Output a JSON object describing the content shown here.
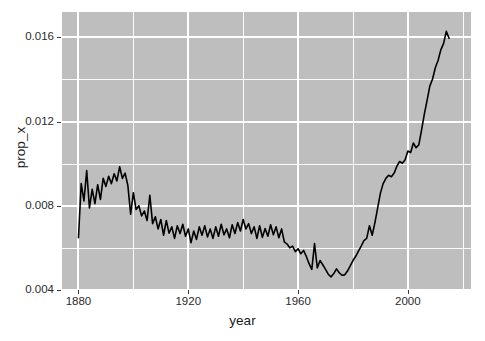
{
  "chart_data": {
    "type": "line",
    "title": "",
    "xlabel": "year",
    "ylabel": "prop_x",
    "xlim": [
      1874,
      2023
    ],
    "ylim": [
      0.004,
      0.0172
    ],
    "grid": true,
    "legend": "none",
    "x_ticks": [
      1880,
      1920,
      1960,
      2000
    ],
    "x_tick_labels": [
      "1880",
      "1920",
      "1960",
      "2000"
    ],
    "y_ticks": [
      0.004,
      0.008,
      0.012,
      0.016
    ],
    "y_tick_labels": [
      "0.004",
      "0.008",
      "0.012",
      "0.016"
    ],
    "x_minor_ticks": [
      1900,
      1940,
      1980,
      2020
    ],
    "y_minor_ticks": [
      0.006,
      0.01,
      0.014
    ],
    "series": [
      {
        "name": "prop_x",
        "color": "#000000",
        "x": [
          1880,
          1881,
          1882,
          1883,
          1884,
          1885,
          1886,
          1887,
          1888,
          1889,
          1890,
          1891,
          1892,
          1893,
          1894,
          1895,
          1896,
          1897,
          1898,
          1899,
          1900,
          1901,
          1902,
          1903,
          1904,
          1905,
          1906,
          1907,
          1908,
          1909,
          1910,
          1911,
          1912,
          1913,
          1914,
          1915,
          1916,
          1917,
          1918,
          1919,
          1920,
          1921,
          1922,
          1923,
          1924,
          1925,
          1926,
          1927,
          1928,
          1929,
          1930,
          1931,
          1932,
          1933,
          1934,
          1935,
          1936,
          1937,
          1938,
          1939,
          1940,
          1941,
          1942,
          1943,
          1944,
          1945,
          1946,
          1947,
          1948,
          1949,
          1950,
          1951,
          1952,
          1953,
          1954,
          1955,
          1956,
          1957,
          1958,
          1959,
          1960,
          1961,
          1962,
          1963,
          1964,
          1965,
          1966,
          1967,
          1968,
          1969,
          1970,
          1971,
          1972,
          1973,
          1974,
          1975,
          1976,
          1977,
          1978,
          1979,
          1980,
          1981,
          1982,
          1983,
          1984,
          1985,
          1986,
          1987,
          1988,
          1989,
          1990,
          1991,
          1992,
          1993,
          1994,
          1995,
          1996,
          1997,
          1998,
          1999,
          2000,
          2001,
          2002,
          2003,
          2004,
          2005,
          2006,
          2007,
          2008,
          2009,
          2010,
          2011,
          2012,
          2013,
          2014,
          2015
        ],
        "y": [
          0.00648,
          0.00905,
          0.00823,
          0.00967,
          0.0079,
          0.00878,
          0.0081,
          0.009,
          0.0083,
          0.0093,
          0.00892,
          0.0094,
          0.00905,
          0.00952,
          0.00918,
          0.00985,
          0.0093,
          0.00955,
          0.00895,
          0.0076,
          0.00862,
          0.00782,
          0.008,
          0.00752,
          0.00775,
          0.0073,
          0.0085,
          0.00715,
          0.00748,
          0.0069,
          0.00735,
          0.0066,
          0.0073,
          0.0067,
          0.007,
          0.00645,
          0.00705,
          0.00668,
          0.00712,
          0.00655,
          0.0069,
          0.00625,
          0.0068,
          0.0064,
          0.007,
          0.0066,
          0.00705,
          0.00652,
          0.0069,
          0.00645,
          0.007,
          0.00655,
          0.00712,
          0.00662,
          0.0069,
          0.00648,
          0.0071,
          0.00668,
          0.0072,
          0.0068,
          0.00735,
          0.0069,
          0.00715,
          0.00668,
          0.007,
          0.00645,
          0.00705,
          0.0065,
          0.00692,
          0.00655,
          0.0071,
          0.00662,
          0.007,
          0.00648,
          0.0069,
          0.00628,
          0.00618,
          0.006,
          0.00608,
          0.00582,
          0.00596,
          0.00572,
          0.00588,
          0.0056,
          0.00525,
          0.00498,
          0.0062,
          0.00505,
          0.0054,
          0.0052,
          0.00498,
          0.00475,
          0.00462,
          0.00478,
          0.005,
          0.00482,
          0.0047,
          0.00472,
          0.0049,
          0.00515,
          0.0054,
          0.0056,
          0.00585,
          0.00608,
          0.00635,
          0.00645,
          0.00705,
          0.0066,
          0.0072,
          0.0079,
          0.0086,
          0.00905,
          0.0093,
          0.00945,
          0.00938,
          0.00955,
          0.00988,
          0.0101,
          0.01002,
          0.01018,
          0.0106,
          0.01052,
          0.01098,
          0.01075,
          0.0109,
          0.0116,
          0.01235,
          0.013,
          0.01368,
          0.01402,
          0.01455,
          0.0149,
          0.0154,
          0.0157,
          0.01628,
          0.01595
        ]
      }
    ]
  },
  "axes": {
    "y_title": "prop_x",
    "x_title": "year",
    "y_labels": [
      "0.016",
      "0.012",
      "0.008",
      "0.004"
    ],
    "x_labels": [
      "1880",
      "1920",
      "1960",
      "2000"
    ]
  },
  "style": {
    "panel_background": "#bebebe",
    "gridline_color": "#ffffff",
    "line_color": "#000000",
    "text_color": "#1a1a1a",
    "page_background": "#ffffff"
  }
}
